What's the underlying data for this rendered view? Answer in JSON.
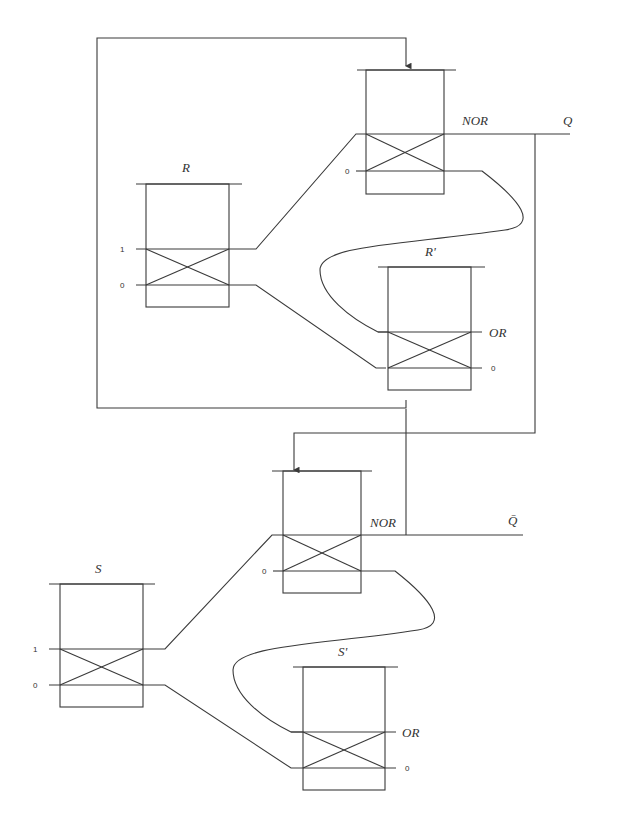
{
  "diagram": {
    "title": "",
    "latch_upper": {
      "input_block": {
        "label": "R",
        "pins": [
          "1",
          "0"
        ]
      },
      "nor_block": {
        "label": "NOR",
        "pin": "0"
      },
      "or_block": {
        "label": "R'",
        "gate": "OR",
        "pin": "0"
      },
      "output": "Q"
    },
    "latch_lower": {
      "input_block": {
        "label": "S",
        "pins": [
          "1",
          "0"
        ]
      },
      "nor_block": {
        "label": "NOR",
        "pin": "0"
      },
      "or_block": {
        "label": "S'",
        "gate": "OR",
        "pin": "0"
      },
      "output": "Q̄"
    }
  }
}
